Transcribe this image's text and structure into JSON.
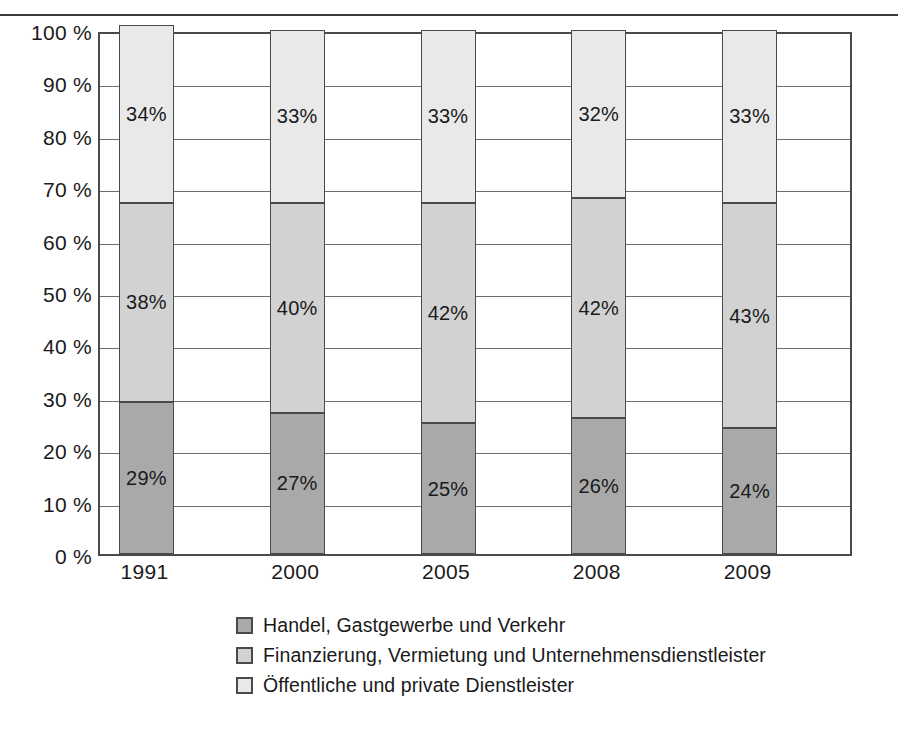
{
  "chart_data": {
    "type": "bar",
    "subtype": "stacked-100-percent",
    "title": "",
    "xlabel": "",
    "ylabel": "",
    "ylim": [
      0,
      100
    ],
    "grid": true,
    "legend_position": "bottom",
    "categories": [
      "1991",
      "2000",
      "2005",
      "2008",
      "2009"
    ],
    "ytick_labels": [
      "100 %",
      "90 %",
      "80 %",
      "70 %",
      "60 %",
      "50 %",
      "40 %",
      "30 %",
      "20 %",
      "10 %",
      "0 %"
    ],
    "ytick_values": [
      100,
      90,
      80,
      70,
      60,
      50,
      40,
      30,
      20,
      10,
      0
    ],
    "series": [
      {
        "name": "Handel, Gastgewerbe und Verkehr",
        "color": "#a9a9a9",
        "values": [
          29,
          27,
          25,
          26,
          24
        ],
        "labels": [
          "29%",
          "27%",
          "25%",
          "26%",
          "24%"
        ]
      },
      {
        "name": "Finanzierung, Vermietung und Unternehmensdienstleister",
        "color": "#d2d2d2",
        "values": [
          38,
          40,
          42,
          42,
          43
        ],
        "labels": [
          "38%",
          "40%",
          "42%",
          "42%",
          "43%"
        ]
      },
      {
        "name": "Öffentliche und private Dienstleister",
        "color": "#e9e9e9",
        "values": [
          34,
          33,
          33,
          32,
          33
        ],
        "labels": [
          "34%",
          "33%",
          "33%",
          "32%",
          "33%"
        ]
      }
    ]
  },
  "legend": {
    "items": [
      {
        "label": "Handel, Gastgewerbe und Verkehr",
        "color": "#a9a9a9"
      },
      {
        "label": "Finanzierung, Vermietung und Unternehmensdienstleister",
        "color": "#d2d2d2"
      },
      {
        "label": "Öffentliche und private Dienstleister",
        "color": "#e9e9e9"
      }
    ]
  },
  "colors": {
    "axis": "#4a4a4a",
    "grid": "#6e6e6e",
    "text": "#1a1a1a",
    "background": "#ffffff",
    "rule": "#3a3a3a"
  }
}
